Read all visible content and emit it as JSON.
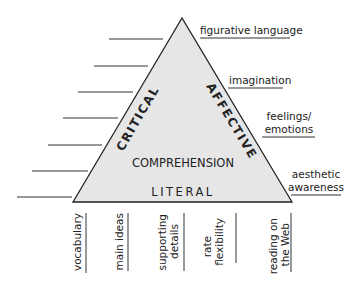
{
  "diagram": {
    "type": "comprehension-triangle",
    "triangle": {
      "fill": "#e6e6e6",
      "stroke": "#222222",
      "left_side_label": "CRITICAL",
      "right_side_label": "AFFECTIVE",
      "center_label": "COMPREHENSION",
      "base_label": "LITERAL"
    },
    "left_blank_lines_count": 7,
    "right_labels": [
      {
        "lines": [
          "figurative language"
        ]
      },
      {
        "lines": [
          "imagination"
        ]
      },
      {
        "lines": [
          "feelings/",
          "emotions"
        ]
      },
      {
        "lines": [
          "aesthetic",
          "awareness"
        ]
      }
    ],
    "bottom_labels": [
      {
        "lines": [
          "vocabulary"
        ]
      },
      {
        "lines": [
          "main ideas"
        ]
      },
      {
        "lines": [
          "supporting",
          "details"
        ]
      },
      {
        "lines": [
          "rate",
          "flexibility"
        ]
      },
      {
        "lines": [
          "reading on",
          "the Web"
        ]
      }
    ]
  }
}
